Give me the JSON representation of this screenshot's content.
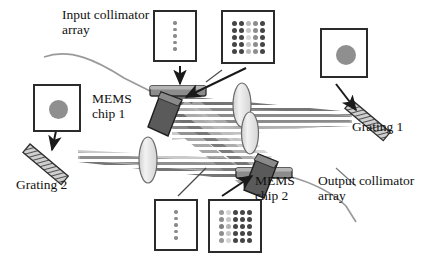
{
  "figure": {
    "background_color": "#ffffff",
    "ink_color": "#1a1a1a"
  },
  "labels": {
    "input_collimator": "Input collimator\narray",
    "output_collimator": "Output collimator\narray",
    "mems_chip_1": "MEMS\nchip 1",
    "mems_chip_2": "MEMS\nchip 2",
    "grating_1": "Grating 1",
    "grating_2": "Grating 2"
  },
  "insets": [
    {
      "name": "input-collimator-spot-column",
      "kind": "dot-column",
      "dot_count": 5,
      "dot_color": "#8a8a8a",
      "border_color": "#2b2b2b"
    },
    {
      "name": "mems-chip-1-spot-matrix",
      "kind": "dot-matrix",
      "rows": 5,
      "cols": 5,
      "dot_colors": [
        [
          "#454545",
          "#454545",
          "#b9b9b9",
          "#8d8d8d",
          "#454545"
        ],
        [
          "#454545",
          "#454545",
          "#c6c6c6",
          "#8d8d8d",
          "#454545"
        ],
        [
          "#454545",
          "#454545",
          "#d8d8d8",
          "#8d8d8d",
          "#454545"
        ],
        [
          "#454545",
          "#454545",
          "#c6c6c6",
          "#8d8d8d",
          "#454545"
        ],
        [
          "#454545",
          "#454545",
          "#b9b9b9",
          "#8d8d8d",
          "#454545"
        ]
      ],
      "border_color": "#2b2b2b"
    },
    {
      "name": "grating-1-focused-spot",
      "kind": "single-spot",
      "dot_color": "#8f8f8f",
      "border_color": "#2b2b2b"
    },
    {
      "name": "grating-2-focused-spot",
      "kind": "single-spot",
      "dot_color": "#8f8f8f",
      "border_color": "#2b2b2b"
    },
    {
      "name": "output-collimator-spot-column",
      "kind": "dot-column",
      "dot_count": 5,
      "dot_color": "#8a8a8a",
      "border_color": "#2b2b2b"
    },
    {
      "name": "mems-chip-2-spot-matrix",
      "kind": "dot-matrix",
      "rows": 5,
      "cols": 5,
      "dot_colors": [
        [
          "#9a9a9a",
          "#d4d4d4",
          "#454545",
          "#454545",
          "#454545"
        ],
        [
          "#8d8d8d",
          "#c6c6c6",
          "#454545",
          "#454545",
          "#454545"
        ],
        [
          "#7f7f7f",
          "#b3b3b3",
          "#454545",
          "#454545",
          "#454545"
        ],
        [
          "#8d8d8d",
          "#c6c6c6",
          "#454545",
          "#454545",
          "#454545"
        ],
        [
          "#9a9a9a",
          "#d4d4d4",
          "#454545",
          "#454545",
          "#454545"
        ]
      ],
      "border_color": "#2b2b2b"
    }
  ],
  "components": {
    "collimator_bars": [
      {
        "name": "input-collimator-bar",
        "fill": "#8c8c8c",
        "stroke": "#2b2b2b"
      },
      {
        "name": "output-collimator-bar",
        "fill": "#8c8c8c",
        "stroke": "#2b2b2b"
      }
    ],
    "mems_chips": [
      {
        "name": "mems-chip-1-body",
        "fill": "#5c5c5c",
        "stroke": "#1f1f1f"
      },
      {
        "name": "mems-chip-2-body",
        "fill": "#5c5c5c",
        "stroke": "#1f1f1f"
      }
    ],
    "lenses": [
      {
        "name": "lens-upper",
        "fill": "#e3e3e3",
        "stroke": "#5a5a5a"
      },
      {
        "name": "lens-middle",
        "fill": "#e3e3e3",
        "stroke": "#5a5a5a"
      },
      {
        "name": "lens-lower",
        "fill": "#e3e3e3",
        "stroke": "#5a5a5a"
      }
    ],
    "gratings": [
      {
        "name": "grating-1-body",
        "fill": "#c9c9c9",
        "stroke": "#3a3a3a"
      },
      {
        "name": "grating-2-body",
        "fill": "#c9c9c9",
        "stroke": "#3a3a3a"
      }
    ],
    "fibers": [
      {
        "name": "input-fiber",
        "stroke": "#9a9a9a"
      },
      {
        "name": "output-fiber",
        "stroke": "#9a9a9a"
      }
    ],
    "beam_color_dark": "#6e6e6e",
    "beam_color_light": "#d2d2d2",
    "arrow_color": "#1a1a1a"
  }
}
